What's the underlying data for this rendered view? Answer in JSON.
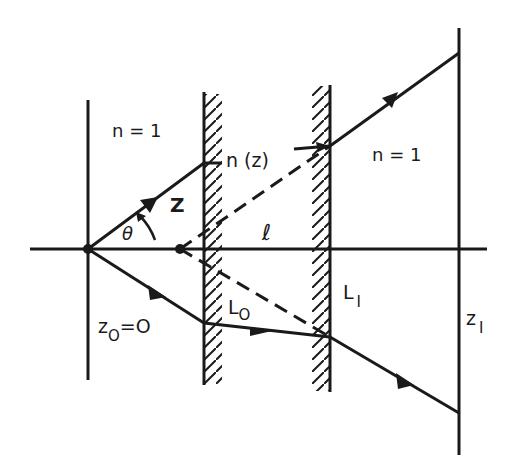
{
  "diagram": {
    "type": "ray-optics schematic",
    "colors": {
      "ink": "#1a1a1a",
      "background": "#ffffff"
    },
    "labels": {
      "left_medium": "n = 1",
      "right_medium": "n = 1",
      "graded_medium": "n (z)",
      "ray_segment": "Z",
      "angle": "θ",
      "distance": "ℓ",
      "source_plane": "z",
      "source_plane_sub": "O",
      "source_plane_eq": "=O",
      "interface_left": "L",
      "interface_left_sub": "O",
      "interface_right": "L",
      "interface_right_sub": "I",
      "image_plane": "z",
      "image_plane_sub": "I"
    },
    "elements": [
      "optical-axis",
      "source-plane z0=0",
      "interface L0 (hatched)",
      "interface L1 (hatched)",
      "image plane z1",
      "upper ray with arrows",
      "lower ray with arrows",
      "dashed virtual rays from apparent source"
    ]
  }
}
